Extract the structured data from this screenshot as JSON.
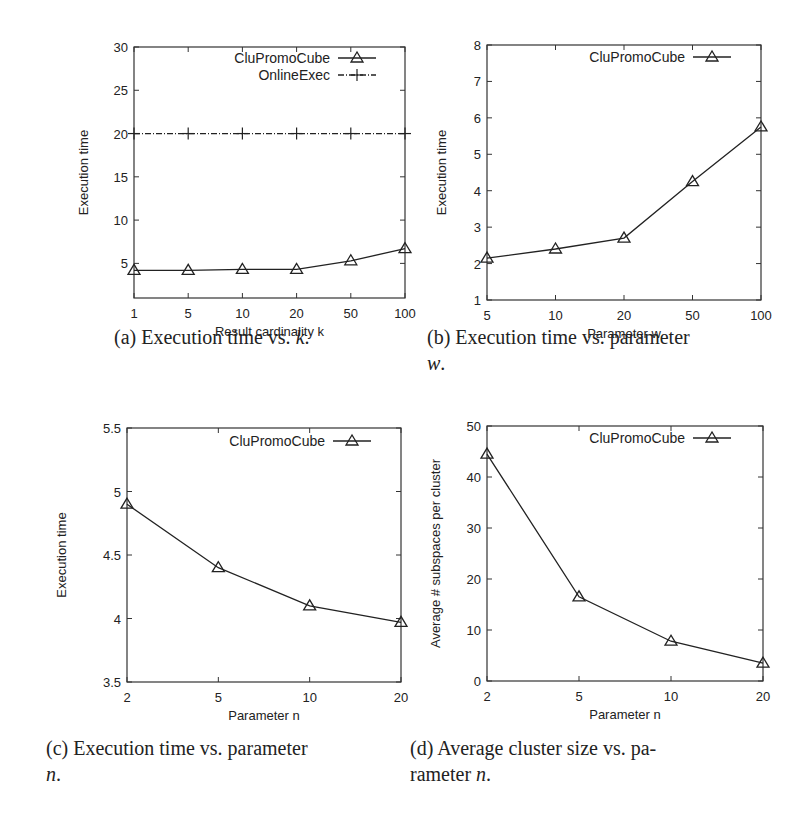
{
  "chart_data": [
    {
      "id": "a",
      "type": "line",
      "title": "",
      "xlabel": "Result cardinality k",
      "ylabel": "Execution time",
      "x": [
        "1",
        "5",
        "10",
        "20",
        "50",
        "100"
      ],
      "ylim": [
        1,
        30
      ],
      "yticks": [
        5,
        10,
        15,
        20,
        25,
        30
      ],
      "grid": false,
      "legend_position": "top-right",
      "series": [
        {
          "name": "CluPromoCube",
          "marker": "triangle",
          "style": "solid",
          "values": [
            4.2,
            4.2,
            4.3,
            4.3,
            5.3,
            6.7
          ]
        },
        {
          "name": "OnlineExec",
          "marker": "plus",
          "style": "dash-dot",
          "values": [
            20,
            20,
            20,
            20,
            20,
            20
          ]
        }
      ],
      "caption_label": "(a)",
      "caption_text": "Execution time vs. ",
      "caption_var": "k",
      "caption_tail": "."
    },
    {
      "id": "b",
      "type": "line",
      "title": "",
      "xlabel": "Parameter w",
      "ylabel": "Execution time",
      "x": [
        "5",
        "10",
        "20",
        "50",
        "100"
      ],
      "ylim": [
        1,
        8
      ],
      "yticks": [
        1,
        2,
        3,
        4,
        5,
        6,
        7,
        8
      ],
      "grid": false,
      "legend_position": "top-right",
      "series": [
        {
          "name": "CluPromoCube",
          "marker": "triangle",
          "style": "solid",
          "values": [
            2.15,
            2.4,
            2.7,
            4.25,
            5.75
          ]
        }
      ],
      "caption_label": "(b)",
      "caption_text": "Execution time vs. parameter",
      "caption_var": "w",
      "caption_tail": "."
    },
    {
      "id": "c",
      "type": "line",
      "title": "",
      "xlabel": "Parameter n",
      "ylabel": "Execution time",
      "x": [
        "2",
        "5",
        "10",
        "20"
      ],
      "ylim": [
        3.5,
        5.5
      ],
      "yticks": [
        3.5,
        4,
        4.5,
        5,
        5.5
      ],
      "grid": false,
      "legend_position": "top-right",
      "series": [
        {
          "name": "CluPromoCube",
          "marker": "triangle",
          "style": "solid",
          "values": [
            4.9,
            4.4,
            4.1,
            3.97
          ]
        }
      ],
      "caption_label": "(c)",
      "caption_text": "Execution time vs. parameter",
      "caption_var": "n",
      "caption_tail": "."
    },
    {
      "id": "d",
      "type": "line",
      "title": "",
      "xlabel": "Parameter n",
      "ylabel": "Average # subspaces per cluster",
      "x": [
        "2",
        "5",
        "10",
        "20"
      ],
      "ylim": [
        0,
        50
      ],
      "yticks": [
        0,
        10,
        20,
        30,
        40,
        50
      ],
      "grid": false,
      "legend_position": "top-right",
      "series": [
        {
          "name": "CluPromoCube",
          "marker": "triangle",
          "style": "solid",
          "values": [
            44.5,
            16.5,
            7.8,
            3.5
          ]
        }
      ],
      "caption_label": "(d)",
      "caption_text": "Average cluster size vs. pa-",
      "caption_text2": "rameter ",
      "caption_var": "n",
      "caption_tail": "."
    }
  ],
  "captions": {
    "a_label": "(a)",
    "a_text": "Execution time vs.",
    "a_var": "k",
    "b_label": "(b)",
    "b_text": "Execution time vs. parameter",
    "b_var": "w",
    "c_label": "(c)",
    "c_text": "Execution time vs. parameter",
    "c_var": "n",
    "d_label": "(d)",
    "d_text": "Average cluster size vs. pa-",
    "d_text2": "rameter",
    "d_var": "n"
  }
}
